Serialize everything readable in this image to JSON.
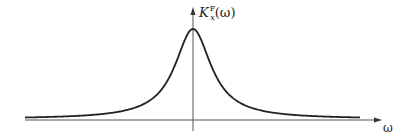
{
  "diagram": {
    "y_axis_label": {
      "main": "K",
      "superscript": "F",
      "subscript": "x",
      "argument": "(ω)"
    },
    "x_axis_label": "ω",
    "colors": {
      "curve": "#222222",
      "axes": "#555555"
    }
  },
  "chart_data": {
    "type": "line",
    "title": "",
    "xlabel": "ω",
    "ylabel": "K_x^F(ω)",
    "series": [
      {
        "name": "K_x^F(ω)",
        "shape": "lorentzian",
        "peak_x": 0,
        "x": [
          -8,
          -6,
          -4,
          -3,
          -2,
          -1.5,
          -1,
          -0.5,
          0,
          0.5,
          1,
          1.5,
          2,
          3,
          4,
          6,
          8
        ],
        "values": [
          0.02,
          0.03,
          0.06,
          0.1,
          0.2,
          0.31,
          0.5,
          0.8,
          1.0,
          0.8,
          0.5,
          0.31,
          0.2,
          0.1,
          0.06,
          0.03,
          0.02
        ]
      }
    ],
    "grid": false,
    "legend": null
  }
}
